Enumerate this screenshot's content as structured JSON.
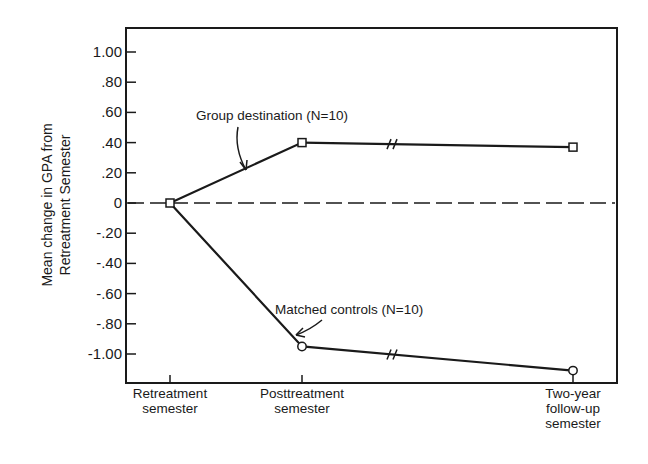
{
  "chart_data": {
    "type": "line",
    "title": "",
    "ylabel": "Mean change in GPA from Retreatment Semester",
    "ylabel_lines": [
      "Mean change in GPA from",
      "Retreatment Semester"
    ],
    "xlabel": "",
    "ylim": [
      -1.2,
      1.2
    ],
    "yticks": [
      1.0,
      0.8,
      0.6,
      0.4,
      0.2,
      0,
      -0.2,
      -0.4,
      -0.6,
      -0.8,
      -1.0
    ],
    "ytick_labels": [
      "1.00",
      ".80",
      ".60",
      ".40",
      ".20",
      "0",
      "-.20",
      "-.40",
      "-.60",
      "-.80",
      "-1.00"
    ],
    "categories": [
      [
        "Retreatment",
        "semester"
      ],
      [
        "Posttreatment",
        "semester"
      ],
      [
        "Two-year",
        "follow-up",
        "semester"
      ]
    ],
    "series": [
      {
        "name": "Group destination (N=10)",
        "marker": "square",
        "values": [
          0,
          0.4,
          0.37
        ]
      },
      {
        "name": "Matched controls (N=10)",
        "marker": "circle",
        "values": [
          0,
          -0.95,
          -1.11
        ]
      }
    ],
    "reference_line": {
      "y": 0,
      "style": "dashed"
    },
    "axis_break": "between Posttreatment and Two-year follow-up",
    "grid": false,
    "legend": "inline annotations with arrows"
  },
  "annotations": {
    "group": "Group destination  (N=10)",
    "controls": "Matched controls  (N=10)"
  }
}
